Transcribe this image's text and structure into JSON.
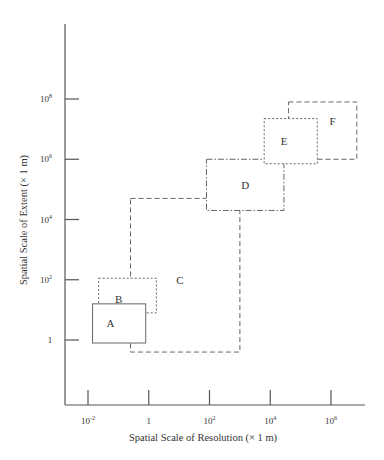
{
  "diagram": {
    "x_axis": {
      "label": "Spatial Scale of Resolution (× 1 m)",
      "scale": "log10",
      "ticks": [
        {
          "value": -2,
          "base": "10",
          "exp": "-2"
        },
        {
          "value": 0,
          "base": "1",
          "exp": ""
        },
        {
          "value": 2,
          "base": "10",
          "exp": "2"
        },
        {
          "value": 4,
          "base": "10",
          "exp": "4"
        },
        {
          "value": 6,
          "base": "10",
          "exp": "6"
        }
      ]
    },
    "y_axis": {
      "label": "Spatial Scale of Extent (× 1 m)",
      "scale": "log10",
      "ticks": [
        {
          "value": 0,
          "base": "1",
          "exp": ""
        },
        {
          "value": 2,
          "base": "10",
          "exp": "2"
        },
        {
          "value": 4,
          "base": "10",
          "exp": "4"
        },
        {
          "value": 6,
          "base": "10",
          "exp": "6"
        },
        {
          "value": 8,
          "base": "10",
          "exp": "8"
        }
      ]
    },
    "regions": [
      {
        "id": "A",
        "label": "A",
        "style": "solid",
        "x_range": [
          -1.85,
          -0.1
        ],
        "y_range": [
          -0.1,
          1.2
        ]
      },
      {
        "id": "B",
        "label": "B",
        "style": "dotted",
        "x_range": [
          -1.65,
          0.25
        ],
        "y_range": [
          0.9,
          2.05
        ]
      },
      {
        "id": "C",
        "label": "C",
        "style": "dashed",
        "x_range": [
          -0.6,
          3.0
        ],
        "y_range": [
          -0.4,
          4.7
        ]
      },
      {
        "id": "D",
        "label": "D",
        "style": "dashdot",
        "x_range": [
          1.9,
          4.45
        ],
        "y_range": [
          4.3,
          6.0
        ]
      },
      {
        "id": "E",
        "label": "E",
        "style": "dotted",
        "x_range": [
          3.8,
          5.55
        ],
        "y_range": [
          5.85,
          7.35
        ]
      },
      {
        "id": "F",
        "label": "F",
        "style": "dashed",
        "x_range": [
          4.6,
          6.85
        ],
        "y_range": [
          6.0,
          7.9
        ]
      }
    ]
  }
}
